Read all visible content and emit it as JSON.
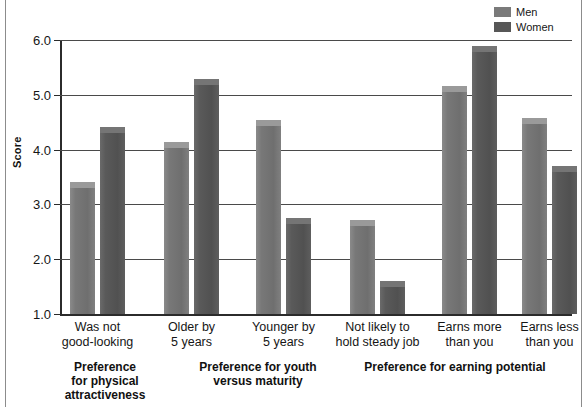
{
  "chart_data": {
    "type": "bar",
    "title": "",
    "xlabel": "",
    "ylabel": "Score",
    "ylim": [
      1.0,
      6.0
    ],
    "yticks": [
      "1.0",
      "2.0",
      "3.0",
      "4.0",
      "5.0",
      "6.0"
    ],
    "grid": true,
    "legend_position": "top-right",
    "categories": [
      "Was not good-looking",
      "Older by 5 years",
      "Younger by 5 years",
      "Not likely to hold steady job",
      "Earns more than you",
      "Earns less than you"
    ],
    "series": [
      {
        "name": "Men",
        "color": "#7a7a7a",
        "values": [
          3.41,
          4.13,
          4.54,
          2.72,
          5.16,
          4.58
        ]
      },
      {
        "name": "Women",
        "color": "#575757",
        "values": [
          4.41,
          5.29,
          2.75,
          1.6,
          5.89,
          3.71
        ]
      }
    ]
  },
  "legend": {
    "items": [
      {
        "label": "Men",
        "color": "#7a7a7a"
      },
      {
        "label": "Women",
        "color": "#575757"
      }
    ]
  },
  "axes": {
    "y_title": "Score",
    "y_tick_labels": [
      "6.0",
      "5.0",
      "4.0",
      "3.0",
      "2.0",
      "1.0"
    ]
  },
  "category_labels": [
    {
      "line1": "Was not",
      "line2": "good-looking"
    },
    {
      "line1": "Older by",
      "line2": "5 years"
    },
    {
      "line1": "Younger by",
      "line2": "5 years"
    },
    {
      "line1": "Not likely to",
      "line2": "hold steady job"
    },
    {
      "line1": "Earns more",
      "line2": "than you"
    },
    {
      "line1": "Earns less",
      "line2": "than you"
    }
  ],
  "group_titles": [
    {
      "line1": "Preference",
      "line2": "for physical",
      "line3": "attractiveness"
    },
    {
      "line1": "Preference for youth",
      "line2": "versus maturity",
      "line3": ""
    },
    {
      "line1": "Preference for earning potential",
      "line2": "",
      "line3": ""
    }
  ]
}
